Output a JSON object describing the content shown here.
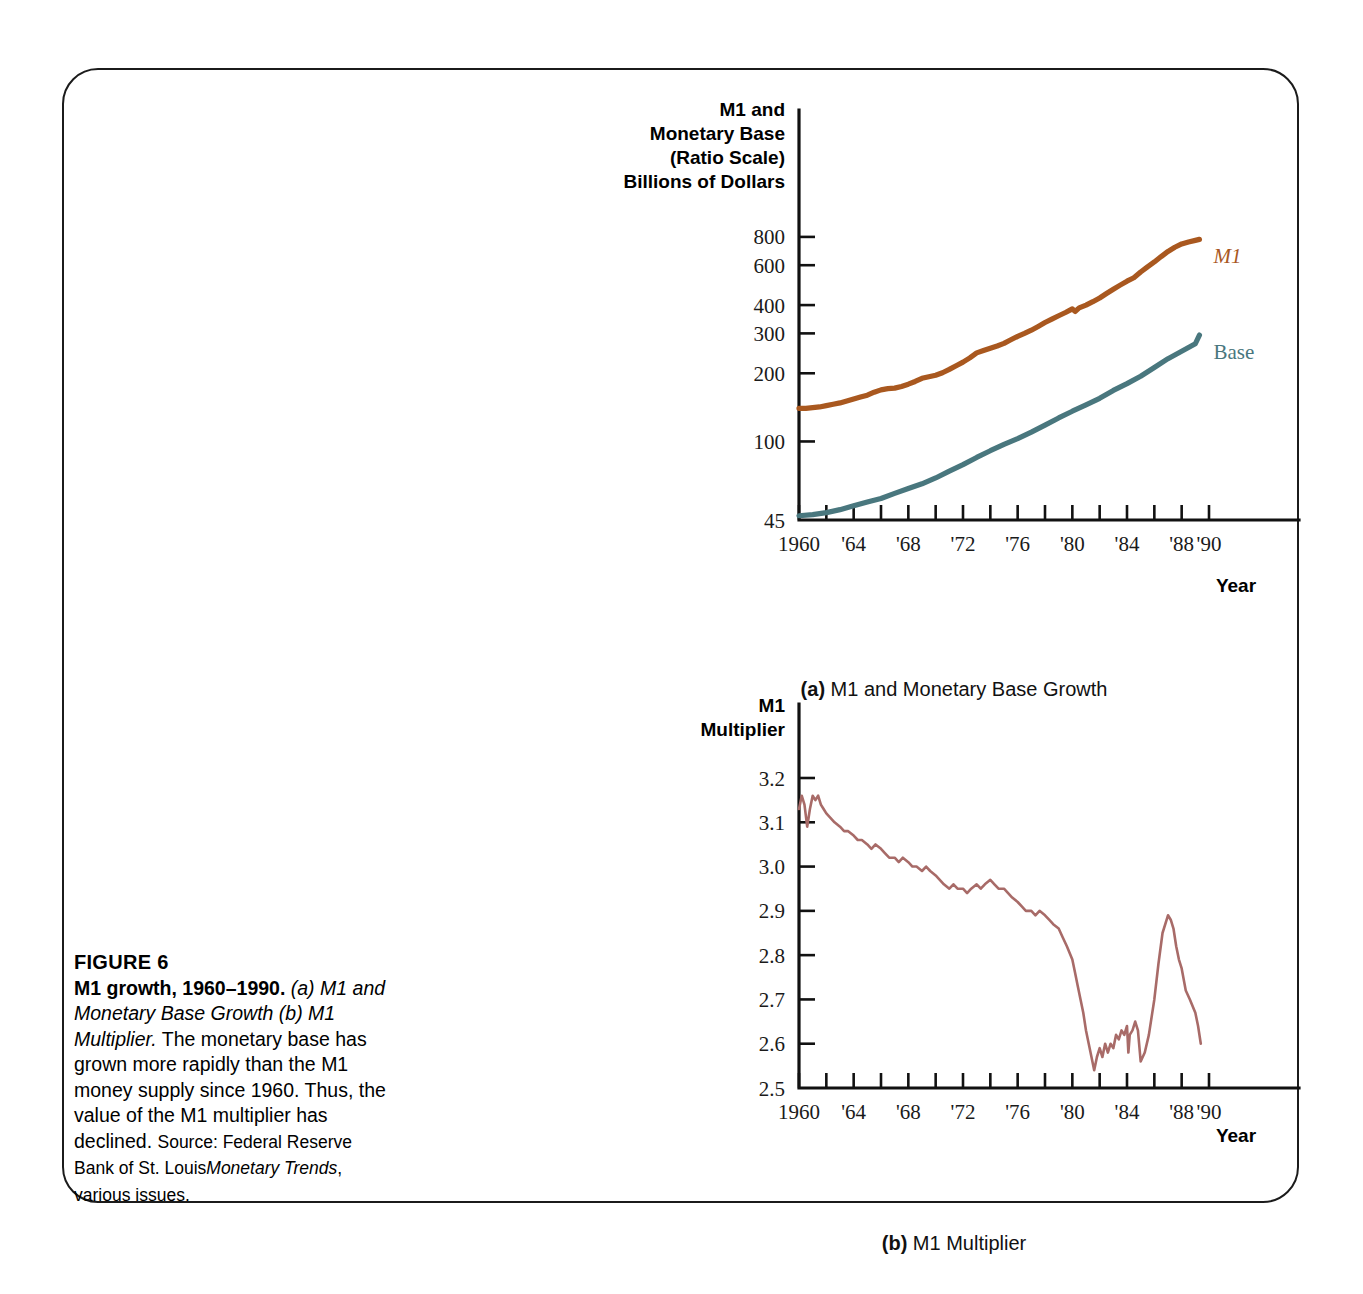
{
  "figure": {
    "label": "FIGURE 6",
    "title": "M1 growth, 1960–1990.",
    "subtitle_italic": "(a) M1 and Monetary Base Growth (b) M1 Multiplier.",
    "body": "The monetary base has grown more rapidly than the M1 money supply since 1960. Thus, the value of the M1 multiplier has declined.",
    "source_prefix": "Source: Federal Reserve Bank of St. Louis",
    "source_italic": "Monetary Trends",
    "source_suffix": ", various issues."
  },
  "subcaptions": {
    "a_marker": "(a)",
    "a_text": " M1 and Monetary Base Growth",
    "b_marker": "(b)",
    "b_text": " M1 Multiplier"
  },
  "colors": {
    "m1": "#A9581F",
    "base": "#49777E",
    "multiplier": "#A86B68",
    "axis": "#111111",
    "border": "#1b1b1b"
  },
  "chart_data": [
    {
      "type": "line",
      "id": "panel-a",
      "title": "M1 and Monetary Base Growth",
      "ylabel_lines": [
        "M1 and",
        "Monetary Base",
        "(Ratio Scale)",
        "Billions of Dollars"
      ],
      "xlabel": "Year",
      "yscale": "log",
      "ylim": [
        45,
        950
      ],
      "yticks": [
        45,
        100,
        200,
        300,
        400,
        600,
        800
      ],
      "ytick_labels": [
        "45",
        "100",
        "200",
        "300",
        "400",
        "600",
        "800"
      ],
      "xlim": [
        1960,
        1990
      ],
      "xticks": [
        1960,
        1962,
        1964,
        1966,
        1968,
        1970,
        1972,
        1974,
        1976,
        1978,
        1980,
        1982,
        1984,
        1986,
        1988,
        1990
      ],
      "xtick_labels": [
        "1960",
        "",
        "'64",
        "",
        "'68",
        "",
        "'72",
        "",
        "'76",
        "",
        "'80",
        "",
        "'84",
        "",
        "'88",
        "'90"
      ],
      "grid": false,
      "legend_position": "inline-right",
      "series": [
        {
          "name": "M1",
          "label": "M1",
          "color": "#A9581F",
          "x": [
            1960,
            1960.5,
            1961,
            1961.5,
            1962,
            1962.5,
            1963,
            1963.5,
            1964,
            1964.5,
            1965,
            1965.5,
            1966,
            1966.5,
            1967,
            1967.5,
            1968,
            1968.5,
            1969,
            1969.5,
            1970,
            1970.5,
            1971,
            1971.5,
            1972,
            1972.5,
            1973,
            1973.5,
            1974,
            1974.5,
            1975,
            1975.5,
            1976,
            1976.5,
            1977,
            1977.5,
            1978,
            1978.5,
            1979,
            1979.5,
            1980,
            1980.2,
            1980.5,
            1981,
            1981.5,
            1982,
            1982.5,
            1983,
            1983.5,
            1984,
            1984.5,
            1985,
            1985.5,
            1986,
            1986.5,
            1987,
            1987.5,
            1988,
            1988.5,
            1989,
            1989.3
          ],
          "y": [
            140,
            140,
            141,
            142,
            144,
            146,
            148,
            151,
            154,
            157,
            160,
            165,
            169,
            171,
            172,
            175,
            179,
            184,
            190,
            193,
            196,
            201,
            208,
            216,
            224,
            234,
            246,
            252,
            258,
            264,
            271,
            281,
            291,
            300,
            310,
            322,
            335,
            347,
            359,
            371,
            385,
            375,
            389,
            400,
            414,
            430,
            450,
            470,
            490,
            510,
            528,
            560,
            590,
            620,
            655,
            690,
            720,
            745,
            760,
            772,
            780
          ]
        },
        {
          "name": "Base",
          "label": "Base",
          "color": "#49777E",
          "x": [
            1960,
            1961,
            1962,
            1963,
            1964,
            1965,
            1966,
            1967,
            1968,
            1969,
            1970,
            1971,
            1972,
            1973,
            1974,
            1975,
            1976,
            1977,
            1978,
            1979,
            1980,
            1981,
            1982,
            1983,
            1984,
            1985,
            1986,
            1987,
            1988,
            1989,
            1989.3
          ],
          "y": [
            47,
            47.5,
            48.5,
            50,
            52,
            54,
            56,
            59,
            62,
            65,
            69,
            74,
            79,
            85,
            91,
            97,
            103,
            110,
            118,
            127,
            136,
            145,
            155,
            168,
            180,
            194,
            212,
            232,
            250,
            270,
            295
          ]
        }
      ]
    },
    {
      "type": "line",
      "id": "panel-b",
      "title": "M1 Multiplier",
      "ylabel_lines": [
        "M1",
        "Multiplier"
      ],
      "xlabel": "Year",
      "yscale": "linear",
      "ylim": [
        2.5,
        3.2
      ],
      "yticks": [
        2.5,
        2.6,
        2.7,
        2.8,
        2.9,
        3.0,
        3.1,
        3.2
      ],
      "ytick_labels": [
        "2.5",
        "2.6",
        "2.7",
        "2.8",
        "2.9",
        "3.0",
        "3.1",
        "3.2"
      ],
      "xlim": [
        1960,
        1990
      ],
      "xticks": [
        1960,
        1962,
        1964,
        1966,
        1968,
        1970,
        1972,
        1974,
        1976,
        1978,
        1980,
        1982,
        1984,
        1986,
        1988,
        1990
      ],
      "xtick_labels": [
        "1960",
        "",
        "'64",
        "",
        "'68",
        "",
        "'72",
        "",
        "'76",
        "",
        "'80",
        "",
        "'84",
        "",
        "'88",
        "'90"
      ],
      "grid": false,
      "legend_position": "none",
      "series": [
        {
          "name": "M1 Multiplier",
          "label": "",
          "color": "#A86B68",
          "x": [
            1960.0,
            1960.2,
            1960.4,
            1960.6,
            1960.8,
            1961.0,
            1961.2,
            1961.4,
            1961.6,
            1961.8,
            1962.0,
            1962.3,
            1962.6,
            1963.0,
            1963.3,
            1963.6,
            1964.0,
            1964.3,
            1964.6,
            1965.0,
            1965.3,
            1965.6,
            1966.0,
            1966.3,
            1966.6,
            1967.0,
            1967.3,
            1967.6,
            1968.0,
            1968.3,
            1968.6,
            1969.0,
            1969.3,
            1969.6,
            1970.0,
            1970.3,
            1970.6,
            1971.0,
            1971.3,
            1971.6,
            1972.0,
            1972.3,
            1972.6,
            1973.0,
            1973.3,
            1973.6,
            1974.0,
            1974.3,
            1974.6,
            1975.0,
            1975.3,
            1975.6,
            1976.0,
            1976.3,
            1976.6,
            1977.0,
            1977.3,
            1977.6,
            1978.0,
            1978.3,
            1978.6,
            1979.0,
            1979.3,
            1979.6,
            1980.0,
            1980.2,
            1980.4,
            1980.6,
            1980.8,
            1981.0,
            1981.2,
            1981.4,
            1981.6,
            1981.8,
            1982.0,
            1982.2,
            1982.4,
            1982.6,
            1982.8,
            1983.0,
            1983.2,
            1983.4,
            1983.6,
            1983.8,
            1984.0,
            1984.1,
            1984.2,
            1984.4,
            1984.6,
            1984.8,
            1985.0,
            1985.3,
            1985.6,
            1986.0,
            1986.3,
            1986.6,
            1987.0,
            1987.2,
            1987.4,
            1987.6,
            1987.8,
            1988.0,
            1988.3,
            1988.6,
            1989.0,
            1989.2,
            1989.4
          ],
          "y": [
            3.13,
            3.16,
            3.14,
            3.09,
            3.13,
            3.16,
            3.15,
            3.16,
            3.14,
            3.13,
            3.12,
            3.11,
            3.1,
            3.09,
            3.08,
            3.08,
            3.07,
            3.06,
            3.06,
            3.05,
            3.04,
            3.05,
            3.04,
            3.03,
            3.02,
            3.02,
            3.01,
            3.02,
            3.01,
            3.0,
            3.0,
            2.99,
            3.0,
            2.99,
            2.98,
            2.97,
            2.96,
            2.95,
            2.96,
            2.95,
            2.95,
            2.94,
            2.95,
            2.96,
            2.95,
            2.96,
            2.97,
            2.96,
            2.95,
            2.95,
            2.94,
            2.93,
            2.92,
            2.91,
            2.9,
            2.9,
            2.89,
            2.9,
            2.89,
            2.88,
            2.87,
            2.86,
            2.84,
            2.82,
            2.79,
            2.76,
            2.73,
            2.7,
            2.67,
            2.63,
            2.6,
            2.57,
            2.54,
            2.57,
            2.59,
            2.57,
            2.6,
            2.58,
            2.6,
            2.59,
            2.62,
            2.61,
            2.63,
            2.62,
            2.64,
            2.58,
            2.62,
            2.63,
            2.65,
            2.63,
            2.56,
            2.58,
            2.62,
            2.7,
            2.78,
            2.85,
            2.89,
            2.88,
            2.86,
            2.82,
            2.79,
            2.77,
            2.72,
            2.7,
            2.67,
            2.64,
            2.6
          ]
        }
      ]
    }
  ]
}
